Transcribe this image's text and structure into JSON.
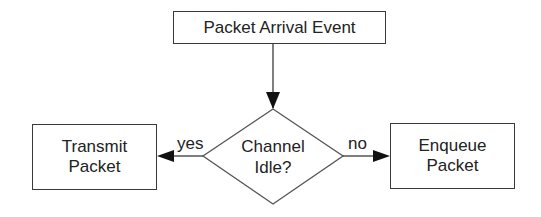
{
  "diagram": {
    "type": "flowchart",
    "nodes": {
      "start": {
        "label": "Packet Arrival Event",
        "shape": "rectangle"
      },
      "decision": {
        "line1": "Channel",
        "line2": "Idle?",
        "shape": "diamond"
      },
      "transmit": {
        "line1": "Transmit",
        "line2": "Packet",
        "shape": "rectangle"
      },
      "enqueue": {
        "line1": "Enqueue",
        "line2": "Packet",
        "shape": "rectangle"
      }
    },
    "edges": [
      {
        "from": "start",
        "to": "decision",
        "label": ""
      },
      {
        "from": "decision",
        "to": "transmit",
        "label": "yes"
      },
      {
        "from": "decision",
        "to": "enqueue",
        "label": "no"
      }
    ],
    "edge_labels": {
      "yes": "yes",
      "no": "no"
    },
    "colors": {
      "stroke": "#3a3a3a",
      "text": "#222222",
      "background": "#ffffff"
    }
  }
}
